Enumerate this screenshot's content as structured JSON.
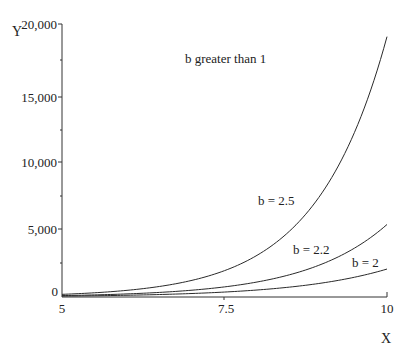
{
  "chart_data": {
    "type": "line",
    "title": "b greater than 1",
    "xlabel": "X",
    "ylabel": "Y",
    "xlim": [
      5,
      10
    ],
    "ylim": [
      0,
      20000
    ],
    "grid": false,
    "legend": "inline labels near curves",
    "x_ticks": [
      {
        "value": 5,
        "label": "5"
      },
      {
        "value": 7.5,
        "label": "7.5"
      },
      {
        "value": 10,
        "label": "10"
      }
    ],
    "y_ticks": [
      {
        "value": 0,
        "label": "0"
      },
      {
        "value": 5000,
        "label": "5,000"
      },
      {
        "value": 10000,
        "label": "10,000"
      },
      {
        "value": 15000,
        "label": "15,000"
      },
      {
        "value": 20000,
        "label": "20,000"
      }
    ],
    "y_minor_ticks": [
      2500,
      7500,
      12500,
      17500
    ],
    "formula": "y = 2 * b^x",
    "x": [
      5,
      5.5,
      6,
      6.5,
      7,
      7.5,
      8,
      8.5,
      9,
      9.5,
      10
    ],
    "series": [
      {
        "name": "b = 2.5",
        "b": 2.5,
        "values": [
          195,
          309,
          488,
          772,
          1221,
          1929,
          3052,
          4826,
          7629,
          12063,
          19073
        ]
      },
      {
        "name": "b = 2.2",
        "b": 2.2,
        "values": [
          103,
          152,
          227,
          336,
          499,
          740,
          1098,
          1629,
          2415,
          3583,
          5313
        ]
      },
      {
        "name": "b = 2",
        "b": 2,
        "values": [
          64,
          91,
          128,
          181,
          256,
          362,
          512,
          724,
          1024,
          1448,
          2048
        ]
      }
    ],
    "annotations": [
      {
        "text": "b greater than 1",
        "x": 6.95,
        "y": 18300
      },
      {
        "text": "b = 2.5",
        "x": 8.0,
        "y": 6500
      },
      {
        "text": "b = 2.2",
        "x": 8.6,
        "y": 3300
      },
      {
        "text": "b = 2",
        "x": 9.15,
        "y": 2050
      }
    ]
  },
  "labels": {
    "title": "b greater than 1",
    "x_axis": "X",
    "y_axis": "Y",
    "x_tick_5": "5",
    "x_tick_7_5": "7.5",
    "x_tick_10": "10",
    "y_tick_0": "0",
    "y_tick_5000": "5,000",
    "y_tick_10000": "10,000",
    "y_tick_15000": "15,000",
    "y_tick_20000": "20,000",
    "curve_b25": "b = 2.5",
    "curve_b22": "b = 2.2",
    "curve_b2": "b = 2"
  }
}
